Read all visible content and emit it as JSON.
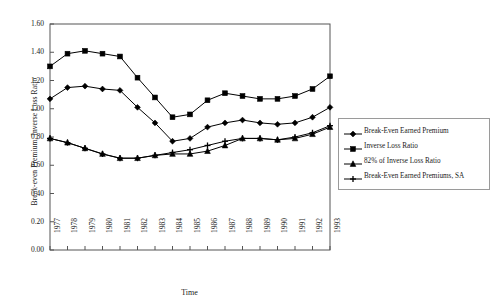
{
  "chart_data": {
    "type": "line",
    "title": "",
    "xlabel": "Time",
    "ylabel": "Break-even Premium, Inverse Loss Ratio",
    "x": [
      1977,
      1978,
      1979,
      1980,
      1981,
      1982,
      1983,
      1984,
      1985,
      1986,
      1987,
      1988,
      1989,
      1990,
      1991,
      1992,
      1993
    ],
    "categories": [
      "1977",
      "1978",
      "1979",
      "1980",
      "1981",
      "1982",
      "1983",
      "1984",
      "1985",
      "1986",
      "1987",
      "1988",
      "1989",
      "1990",
      "1991",
      "1992",
      "1993"
    ],
    "ylim": [
      0.0,
      1.6
    ],
    "yticks": [
      "0.00",
      "0.20",
      "0.40",
      "0.60",
      "0.80",
      "1.00",
      "1.20",
      "1.40",
      "1.60"
    ],
    "ytick_values": [
      0.0,
      0.2,
      0.4,
      0.6,
      0.8,
      1.0,
      1.2,
      1.4,
      1.6
    ],
    "grid": false,
    "legend_position": "right",
    "series": [
      {
        "name": "Break-Even Earned Premium",
        "marker": "diamond",
        "color": "#000000",
        "values": [
          1.07,
          1.15,
          1.16,
          1.14,
          1.13,
          1.01,
          0.9,
          0.77,
          0.79,
          0.87,
          0.9,
          0.92,
          0.9,
          0.89,
          0.9,
          0.94,
          1.01
        ]
      },
      {
        "name": "Inverse Loss Ratio",
        "marker": "square",
        "color": "#000000",
        "values": [
          1.3,
          1.39,
          1.41,
          1.39,
          1.37,
          1.22,
          1.08,
          0.94,
          0.96,
          1.06,
          1.11,
          1.09,
          1.07,
          1.07,
          1.09,
          1.14,
          1.23
        ]
      },
      {
        "name": "82% of Inverse Loss Ratio",
        "marker": "triangle",
        "color": "#000000",
        "values": [
          0.79,
          0.76,
          0.72,
          0.68,
          0.65,
          0.65,
          0.67,
          0.68,
          0.68,
          0.7,
          0.74,
          0.79,
          0.79,
          0.78,
          0.79,
          0.82,
          0.87
        ]
      },
      {
        "name": "Break-Even Earned Premiums, SA",
        "marker": "cross",
        "color": "#000000",
        "values": [
          0.79,
          0.76,
          0.72,
          0.68,
          0.65,
          0.65,
          0.67,
          0.69,
          0.71,
          0.74,
          0.77,
          0.79,
          0.79,
          0.78,
          0.8,
          0.83,
          0.88
        ]
      }
    ]
  }
}
